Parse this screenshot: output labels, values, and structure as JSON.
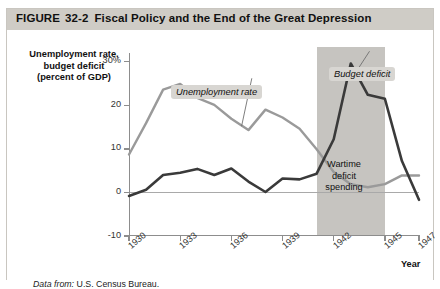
{
  "figure": {
    "label": "FIGURE",
    "number": "32-2",
    "title": "Fiscal Policy and the End of the Great Depression",
    "source_prefix": "Data from:",
    "source_text": "U.S. Census Bureau."
  },
  "axis": {
    "y_title_line1": "Unemployment rate,",
    "y_title_line2": "budget deficit",
    "y_title_line3": "(percent of GDP)",
    "x_title": "Year"
  },
  "annotations": {
    "unemployment_callout": "Unemployment rate",
    "deficit_callout": "Budget deficit",
    "shaded_label_line1": "Wartime",
    "shaded_label_line2": "deficit",
    "shaded_label_line3": "spending"
  },
  "colors": {
    "unemployment_line": "#9a9a9a",
    "deficit_line": "#3a3a3a",
    "shaded_band": "#c6c4c0",
    "title_bar": "#cfccc6",
    "callout_bg": "#d8d6d2",
    "axis": "#8d8d8d"
  },
  "chart_data": {
    "type": "line",
    "title": "Fiscal Policy and the End of the Great Depression",
    "xlabel": "Year",
    "ylabel": "Unemployment rate, budget deficit (percent of GDP)",
    "xlim": [
      1930,
      1947
    ],
    "ylim": [
      -10,
      32
    ],
    "yticks": [
      30,
      20,
      10,
      0,
      -10
    ],
    "ytick_labels": [
      "30%",
      "20",
      "10",
      "0",
      "-10"
    ],
    "xticks": [
      1930,
      1933,
      1936,
      1939,
      1942,
      1945,
      1947
    ],
    "xtick_labels": [
      "1930",
      "1933",
      "1936",
      "1939",
      "1942",
      "1945",
      "1947"
    ],
    "grid": false,
    "legend": "inline-callouts",
    "shaded_region": {
      "x_start": 1941,
      "x_end": 1945,
      "label": "Wartime deficit spending"
    },
    "x": [
      1930,
      1931,
      1932,
      1933,
      1934,
      1935,
      1936,
      1937,
      1938,
      1939,
      1940,
      1941,
      1942,
      1943,
      1944,
      1945,
      1946,
      1947
    ],
    "series": [
      {
        "name": "Unemployment rate",
        "color": "#9a9a9a",
        "values": [
          8.7,
          15.9,
          23.6,
          24.9,
          21.7,
          20.1,
          16.9,
          14.3,
          19.0,
          17.2,
          14.6,
          9.9,
          4.7,
          1.9,
          1.2,
          1.9,
          3.9,
          3.9
        ]
      },
      {
        "name": "Budget deficit",
        "color": "#3a3a3a",
        "values": [
          -0.8,
          0.6,
          4.0,
          4.5,
          5.4,
          4.0,
          5.5,
          2.5,
          0.1,
          3.2,
          3.0,
          4.3,
          12.2,
          29.6,
          22.4,
          21.5,
          7.2,
          -1.7
        ]
      }
    ]
  }
}
